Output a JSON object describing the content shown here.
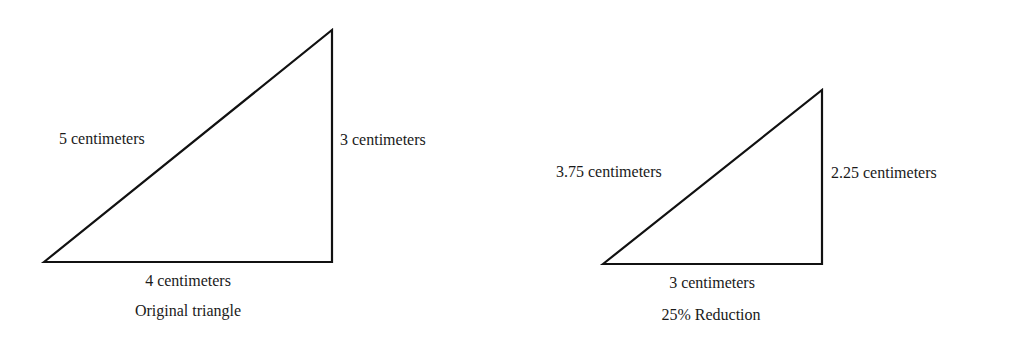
{
  "diagram": {
    "line_color": "#111111",
    "triangles": [
      {
        "id": "original",
        "caption": "Original triangle",
        "hypotenuse_label": "5 centimeters",
        "vertical_label": "3 centimeters",
        "base_label": "4 centimeters",
        "points": "44,262 332,30 332,262"
      },
      {
        "id": "reduced",
        "caption": "25% Reduction",
        "hypotenuse_label": "3.75 centimeters",
        "vertical_label": "2.25 centimeters",
        "base_label": "3 centimeters",
        "points": "603,264 822,90 822,264"
      }
    ]
  }
}
